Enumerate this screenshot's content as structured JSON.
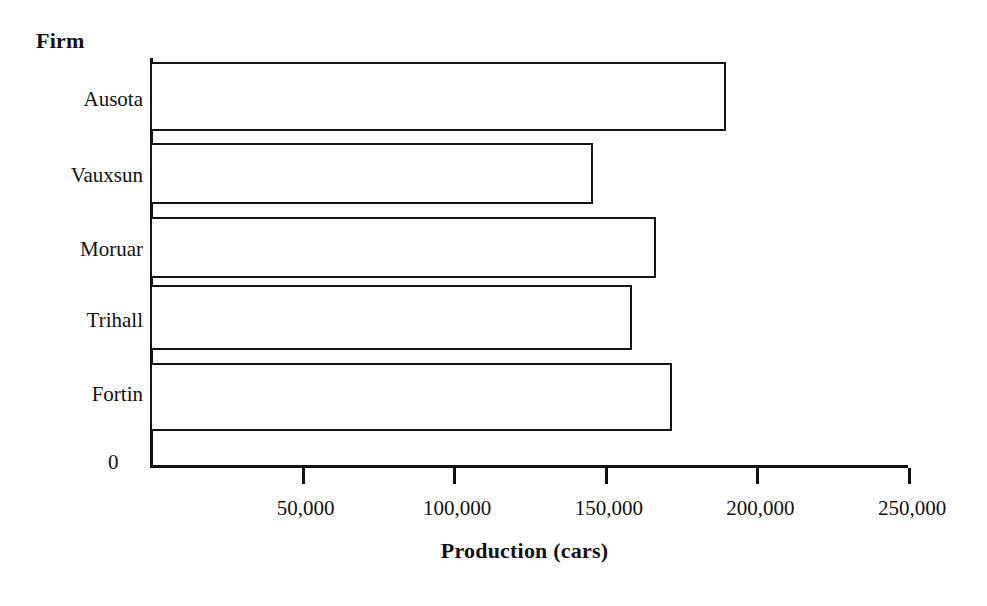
{
  "chart_data": {
    "type": "bar",
    "orientation": "horizontal",
    "title": "",
    "xlabel": "Production (cars)",
    "ylabel": "Firm",
    "categories": [
      "Ausota",
      "Vauxsun",
      "Moruar",
      "Trihall",
      "Fortin"
    ],
    "values": [
      190000,
      146000,
      167000,
      159000,
      172000
    ],
    "series": [
      {
        "name": "Production",
        "values": [
          190000,
          146000,
          167000,
          159000,
          172000
        ]
      }
    ],
    "xlim": [
      0,
      250000
    ],
    "xticks": [
      0,
      50000,
      100000,
      150000,
      200000,
      250000
    ],
    "xticklabels": [
      "0",
      "50,000",
      "100,000",
      "150,000",
      "200,000",
      "250,000"
    ],
    "zero_label": "0",
    "grid": false,
    "legend": false,
    "legend_position": "none",
    "bar_fill_color": "#ffffff",
    "bar_edge_color": "#141414",
    "axis_color": "#111111",
    "background_color": "#fefefe"
  },
  "axes": {
    "y_axis_title": "Firm",
    "x_axis_title": "Production (cars)"
  }
}
